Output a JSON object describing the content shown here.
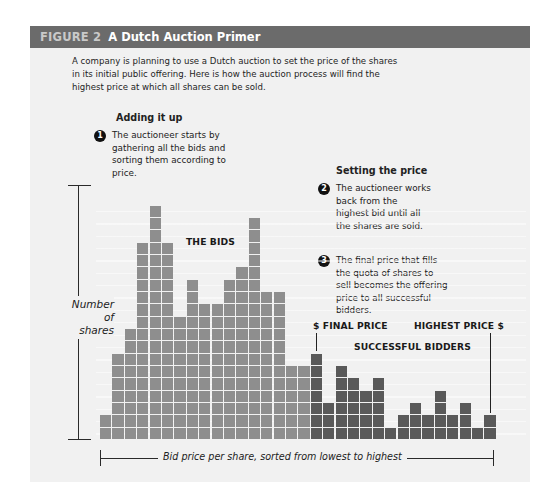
{
  "header": {
    "figure_number": "FIGURE 2",
    "title": "A Dutch Auction Primer",
    "bg_color": "#6b6b6b"
  },
  "intro": "A company is planning to use a Dutch auction to set the price of the shares in its initial public offering. Here is how the auction process will find the highest price at which all shares can be sold.",
  "sections": {
    "adding": {
      "heading": "Adding it up",
      "steps": [
        {
          "number": "1",
          "text": "The auctioneer starts by gathering all the bids and sorting them according to price."
        }
      ]
    },
    "setting": {
      "heading": "Setting the price",
      "steps": [
        {
          "number": "2",
          "text": "The auctioneer works back from the highest bid until all the shares are sold."
        },
        {
          "number": "3",
          "text": "The final price that fills the quota of shares to sell becomes the offering price to all successful bidders."
        }
      ]
    }
  },
  "labels": {
    "the_bids": "THE BIDS",
    "final_price": "$ FINAL PRICE",
    "highest_price": "HIGHEST PRICE $",
    "successful_bidders": "SUCCESSFUL BIDDERS",
    "y_axis_line1": "Number",
    "y_axis_line2": "of shares",
    "x_axis": "Bid price per share, sorted from lowest to highest"
  },
  "chart_data": {
    "type": "bar",
    "title": "A Dutch Auction Primer",
    "xlabel": "Bid price per share, sorted from lowest to highest",
    "ylabel": "Number of shares",
    "categories": [
      "1",
      "2",
      "3",
      "4",
      "5",
      "6",
      "7",
      "8",
      "9",
      "10",
      "11",
      "12",
      "13",
      "14",
      "15",
      "16",
      "17",
      "18",
      "19",
      "20",
      "21",
      "22",
      "23",
      "24",
      "25",
      "26",
      "27",
      "28",
      "29",
      "30",
      "31",
      "32"
    ],
    "series": [
      {
        "name": "Unsuccessful bids",
        "color": "#8e8e8e",
        "values": [
          2,
          7,
          9,
          16,
          19,
          16,
          10,
          13,
          11,
          11,
          13,
          14,
          18,
          12,
          12,
          6,
          6,
          0,
          0,
          0,
          0,
          0,
          0,
          0,
          0,
          0,
          0,
          0,
          0,
          0,
          0,
          0
        ]
      },
      {
        "name": "Successful bidders",
        "color": "#595959",
        "values": [
          0,
          0,
          0,
          0,
          0,
          0,
          0,
          0,
          0,
          0,
          0,
          0,
          0,
          0,
          0,
          0,
          0,
          7,
          3,
          6,
          5,
          4,
          5,
          1,
          2,
          3,
          2,
          4,
          2,
          3,
          1,
          2
        ]
      }
    ],
    "annotations": [
      "THE BIDS",
      "$ FINAL PRICE",
      "HIGHEST PRICE $",
      "SUCCESSFUL BIDDERS"
    ],
    "ylim": [
      0,
      20
    ],
    "grid": false,
    "legend": "none"
  }
}
